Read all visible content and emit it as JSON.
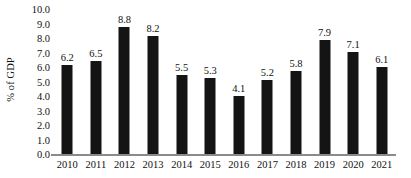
{
  "chart_data": {
    "type": "bar",
    "title": "",
    "subtitle": "",
    "xlabel": "",
    "ylabel": "% of GDP",
    "categories": [
      "2010",
      "2011",
      "2012",
      "2013",
      "2014",
      "2015",
      "2016",
      "2017",
      "2018",
      "2019",
      "2020",
      "2021"
    ],
    "values": [
      6.2,
      6.5,
      8.8,
      8.2,
      5.5,
      5.3,
      4.1,
      5.2,
      5.8,
      7.9,
      7.1,
      6.1
    ],
    "data_labels": [
      "6.2",
      "6.5",
      "8.8",
      "8.2",
      "5.5",
      "5.3",
      "4.1",
      "5.2",
      "5.8",
      "7.9",
      "7.1",
      "6.1"
    ],
    "ylim": [
      0.0,
      10.0
    ],
    "ytick_step": 1.0,
    "ytick_labels": [
      "10.0",
      "9.0",
      "8.0",
      "7.0",
      "6.0",
      "5.0",
      "4.0",
      "3.0",
      "2.0",
      "1.0",
      "0.0"
    ],
    "ytick_values": [
      10.0,
      9.0,
      8.0,
      7.0,
      6.0,
      5.0,
      4.0,
      3.0,
      2.0,
      1.0,
      0.0
    ],
    "grid": false,
    "legend": false,
    "legend_position": "none",
    "bar_color": "#141414",
    "axis_color": "#8a8a8a",
    "text_color": "#111111",
    "background_color": "#ffffff"
  }
}
